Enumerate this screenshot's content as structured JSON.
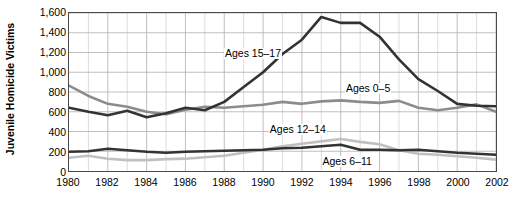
{
  "chart_data": {
    "type": "line",
    "title": "",
    "subtitle": "",
    "xlabel": "",
    "ylabel": "Juvenile Homicide Victims",
    "xlim": [
      1980,
      2002
    ],
    "ylim": [
      0,
      1600
    ],
    "yticks": [
      "0",
      "200",
      "400",
      "600",
      "800",
      "1,000",
      "1,200",
      "1,400",
      "1,600"
    ],
    "ytick_values": [
      0,
      200,
      400,
      600,
      800,
      1000,
      1200,
      1400,
      1600
    ],
    "xticks": [
      "1980",
      "1982",
      "1984",
      "1986",
      "1988",
      "1990",
      "1992",
      "1994",
      "1996",
      "1998",
      "2000",
      "2002"
    ],
    "xtick_values": [
      1980,
      1982,
      1984,
      1986,
      1988,
      1990,
      1992,
      1994,
      1996,
      1998,
      2000,
      2002
    ],
    "grid": true,
    "grid_color": "#b0b0b0",
    "frame_color": "#4a4a4a",
    "legend": "inline-annotations",
    "x": [
      1980,
      1981,
      1982,
      1983,
      1984,
      1985,
      1986,
      1987,
      1988,
      1989,
      1990,
      1991,
      1992,
      1993,
      1994,
      1995,
      1996,
      1997,
      1998,
      1999,
      2000,
      2001,
      2002
    ],
    "series": [
      {
        "name": "Ages 15–17",
        "color": "#333333",
        "width": 2.6,
        "label_x": 1988.0,
        "label_y": 1180,
        "values": [
          640,
          600,
          565,
          610,
          545,
          585,
          640,
          615,
          700,
          850,
          1000,
          1185,
          1330,
          1560,
          1500,
          1500,
          1360,
          1130,
          930,
          810,
          680,
          660,
          655
        ]
      },
      {
        "name": "Ages 0–5",
        "color": "#8c8c8c",
        "width": 2.6,
        "label_x": 1994.2,
        "label_y": 830,
        "values": [
          865,
          760,
          680,
          650,
          600,
          575,
          620,
          650,
          640,
          655,
          670,
          700,
          680,
          705,
          715,
          700,
          690,
          710,
          640,
          615,
          640,
          675,
          600
        ]
      },
      {
        "name": "Ages 12–14",
        "color": "#c0c0c0",
        "width": 2.6,
        "label_x": 1990.3,
        "label_y": 420,
        "values": [
          135,
          155,
          125,
          110,
          110,
          120,
          125,
          140,
          155,
          185,
          215,
          250,
          275,
          300,
          325,
          295,
          270,
          210,
          175,
          165,
          150,
          135,
          115
        ]
      },
      {
        "name": "Ages 6–11",
        "color": "#333333",
        "width": 2.6,
        "label_x": 1993.0,
        "label_y": 105,
        "values": [
          195,
          200,
          225,
          210,
          195,
          185,
          195,
          200,
          205,
          210,
          215,
          230,
          235,
          250,
          265,
          215,
          215,
          210,
          215,
          200,
          185,
          175,
          165
        ]
      }
    ]
  }
}
